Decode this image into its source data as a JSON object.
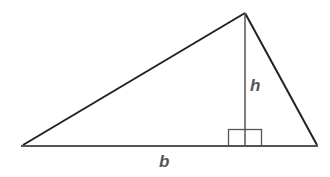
{
  "diagram": {
    "labels": {
      "height": "h",
      "base": "b"
    },
    "colors": {
      "edge": "#222222",
      "base": "#555555",
      "altitude": "#555555",
      "label": "#555555",
      "background": "#ffffff"
    },
    "vertices": {
      "left": [
        23,
        145
      ],
      "apex": [
        245,
        13
      ],
      "right": [
        317,
        145
      ]
    },
    "right_angle_marker": true
  }
}
